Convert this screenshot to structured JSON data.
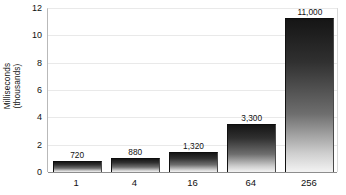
{
  "chart_data": {
    "type": "bar",
    "title": "",
    "subtitle": "",
    "xlabel": "",
    "ylabel": "Milliseconds (thousands)",
    "ylabel_lines": [
      "Milliseconds",
      "(thousands)"
    ],
    "categories": [
      "1",
      "4",
      "16",
      "64",
      "256"
    ],
    "values": [
      0.72,
      0.88,
      1.32,
      3.3,
      11.0
    ],
    "data_labels": [
      "720",
      "880",
      "1,320",
      "3,300",
      "11,000"
    ],
    "bar_top_plotted": [
      0.8,
      1.0,
      1.5,
      3.5,
      11.25
    ],
    "ylim": [
      0,
      12
    ],
    "yticks": [
      0,
      2,
      4,
      6,
      8,
      10,
      12
    ],
    "ytick_labels": [
      "0",
      "2",
      "4",
      "6",
      "8",
      "10",
      "12"
    ],
    "grid": true,
    "grid_axis": "y",
    "legend": false,
    "legend_position": "none",
    "series": [
      {
        "name": "Milliseconds (thousands)",
        "values": [
          0.72,
          0.88,
          1.32,
          3.3,
          11.0
        ]
      }
    ],
    "colors": {
      "bar_top": "#151515",
      "bar_bottom": "#f3f3f3",
      "gridline": "#e9e9e9",
      "axis": "#8d8d8d",
      "text": "#111111",
      "background": "#ffffff"
    }
  }
}
